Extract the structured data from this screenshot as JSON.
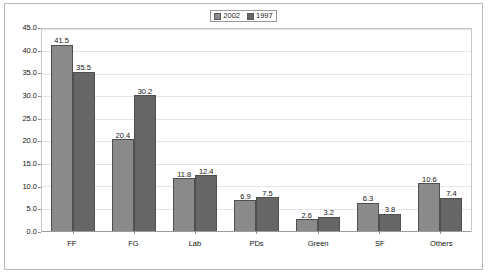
{
  "chart_data": {
    "type": "bar",
    "title": "",
    "subtitle": "",
    "xlabel": "",
    "ylabel": "",
    "categories": [
      "FF",
      "FG",
      "Lab",
      "PDs",
      "Green",
      "SF",
      "Others"
    ],
    "series": [
      {
        "name": "2002",
        "color": "#8a8a8a",
        "values": [
          41.5,
          20.4,
          11.8,
          6.9,
          2.6,
          6.3,
          10.6
        ]
      },
      {
        "name": "1997",
        "color": "#666666",
        "values": [
          35.5,
          30.2,
          12.4,
          7.5,
          3.2,
          3.8,
          7.4
        ]
      }
    ],
    "ylim": [
      0.0,
      45.0
    ],
    "ytick_step": 5.0,
    "yticks": [
      "45.0",
      "40.0",
      "35.0",
      "30.0",
      "25.0",
      "20.0",
      "15.0",
      "10.0",
      "5.0",
      "0.0"
    ],
    "grid": true,
    "grid_axis": "y",
    "legend_position": "top-center",
    "data_labels": true,
    "data_label_format": "one-decimal"
  },
  "legend": {
    "entries": [
      {
        "label": "2002",
        "color": "#8a8a8a"
      },
      {
        "label": "1997",
        "color": "#666666"
      }
    ]
  },
  "colors": {
    "series_2002": "#8a8a8a",
    "series_1997": "#666666",
    "gridline": "#e4e4e4",
    "axis": "#9b9b9b",
    "frame_border": "#b9b9b9",
    "plot_border": "#c8c8c8",
    "text": "#141414",
    "background": "#ffffff"
  }
}
